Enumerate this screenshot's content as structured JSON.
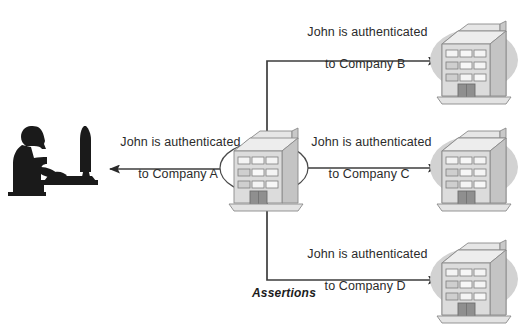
{
  "diagram": {
    "colors": {
      "text": "#2b2b2b",
      "line": "#3d3d3d",
      "silhouette": "#1a1a1a",
      "building_face": "#d8d8d8",
      "building_side": "#bdbdbd",
      "building_top": "#e6e6e6",
      "window": "#f2f2f2",
      "door": "#8f8f8f",
      "shadow": "#d2d2d2",
      "outline": "#6e6e6e",
      "background": "#ffffff"
    },
    "actor": {
      "name": "user-at-computer",
      "label": "John"
    },
    "hub": {
      "name": "identity-provider-cloud",
      "label": "Company A"
    },
    "assertions_label": "Assertions",
    "connections": [
      {
        "id": "a",
        "label_line1": "John is authenticated",
        "label_line2": "to Company A",
        "arrow": "bidirectional",
        "target": "Company A"
      },
      {
        "id": "b",
        "label_line1": "John is authenticated",
        "label_line2": "to Company B",
        "arrow": "right",
        "target": "Company B"
      },
      {
        "id": "c",
        "label_line1": "John is authenticated",
        "label_line2": "to Company C",
        "arrow": "right",
        "target": "Company C"
      },
      {
        "id": "d",
        "label_line1": "John is authenticated",
        "label_line2": "to Company D",
        "arrow": "right",
        "target": "Company D"
      }
    ],
    "buildings": [
      {
        "id": "b",
        "name": "company-b-building"
      },
      {
        "id": "c",
        "name": "company-c-building"
      },
      {
        "id": "d",
        "name": "company-d-building"
      }
    ]
  }
}
